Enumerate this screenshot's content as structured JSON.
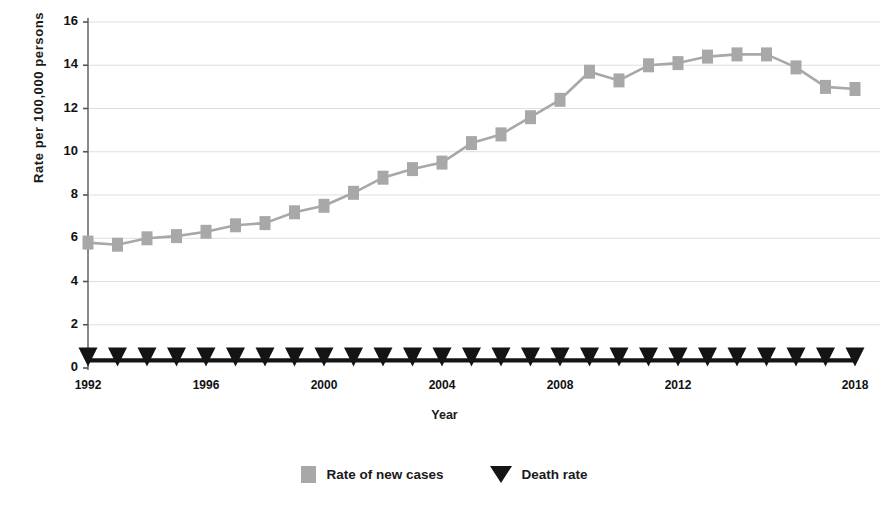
{
  "chart_data": {
    "type": "line",
    "title": "",
    "xlabel": "Year",
    "ylabel": "Rate per 100,000 persons",
    "xlim": [
      1992,
      2018
    ],
    "ylim": [
      0,
      16
    ],
    "ytick_values": [
      0,
      2,
      4,
      6,
      8,
      10,
      12,
      14,
      16
    ],
    "ytick_labels": [
      "0",
      "2",
      "4",
      "6",
      "8",
      "10",
      "12",
      "14",
      "16"
    ],
    "xtick_values": [
      1992,
      1996,
      2000,
      2004,
      2008,
      2012,
      2018
    ],
    "xtick_labels": [
      "1992",
      "1996",
      "2000",
      "2004",
      "2008",
      "2012",
      "2018"
    ],
    "grid": true,
    "grid_axis": "y",
    "legend_position": "bottom",
    "x": [
      1992,
      1993,
      1994,
      1995,
      1996,
      1997,
      1998,
      1999,
      2000,
      2001,
      2002,
      2003,
      2004,
      2005,
      2006,
      2007,
      2008,
      2009,
      2010,
      2011,
      2012,
      2013,
      2014,
      2015,
      2016,
      2017,
      2018
    ],
    "series": [
      {
        "name": "Rate of new cases",
        "color": "#a8a8a8",
        "marker": "square",
        "values": [
          5.8,
          5.7,
          6.0,
          6.1,
          6.3,
          6.6,
          6.7,
          7.2,
          7.5,
          8.1,
          8.8,
          9.2,
          9.5,
          10.4,
          10.8,
          11.6,
          12.4,
          13.7,
          13.3,
          14.0,
          14.1,
          14.4,
          14.5,
          14.5,
          13.9,
          13.0,
          12.9
        ]
      },
      {
        "name": "Death rate",
        "color": "#141414",
        "marker": "triangle-down",
        "values": [
          0.35,
          0.35,
          0.35,
          0.35,
          0.35,
          0.35,
          0.35,
          0.35,
          0.35,
          0.35,
          0.35,
          0.35,
          0.35,
          0.35,
          0.35,
          0.35,
          0.35,
          0.35,
          0.35,
          0.35,
          0.35,
          0.35,
          0.35,
          0.35,
          0.35,
          0.35,
          0.35
        ]
      }
    ]
  },
  "legend": {
    "items": [
      {
        "label": "Rate of new cases",
        "marker": "square-icon"
      },
      {
        "label": "Death rate",
        "marker": "triangle-down-icon"
      }
    ]
  },
  "axes": {
    "y_title": "Rate per 100,000 persons",
    "x_title": "Year"
  }
}
